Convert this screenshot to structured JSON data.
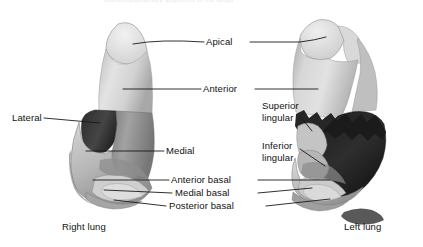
{
  "figure": {
    "title": "Bronchopulmonary segments of the lungs",
    "type": "anatomical-illustration",
    "width": 423,
    "height": 247,
    "background": "#ffffff"
  },
  "labels": {
    "apical": "Apical",
    "anterior": "Anterior",
    "lateral": "Lateral",
    "medial": "Medial",
    "superior_lingular_line1": "Superior",
    "superior_lingular_line2": "lingular",
    "inferior_lingular_line1": "Inferior",
    "inferior_lingular_line2": "lingular",
    "anterior_basal": "Anterior basal",
    "medial_basal": "Medial basal",
    "posterior_basal": "Posterior basal",
    "right_lung": "Right lung",
    "left_lung": "Left lung"
  },
  "colors": {
    "leader_line": "#1a1a1a",
    "label_text": "#111111",
    "upper_lobe_light": "#d8d8d8",
    "upper_lobe_highlight": "#eeeeee",
    "middle_lobe_mid": "#9a9a9a",
    "lower_lobe_dark": "#3a3a3a",
    "lower_lobe_black": "#1c1c1c",
    "basal_pale": "#c9c9c9",
    "outline": "#6a6a6a",
    "background": "#ffffff"
  },
  "structures": {
    "right_lung_segments": [
      "Apical",
      "Anterior",
      "Lateral",
      "Medial",
      "Anterior basal",
      "Medial basal",
      "Posterior basal"
    ],
    "left_lung_segments": [
      "Apical",
      "Anterior",
      "Superior lingular",
      "Inferior lingular",
      "Anterior basal",
      "Medial basal",
      "Posterior basal"
    ]
  }
}
